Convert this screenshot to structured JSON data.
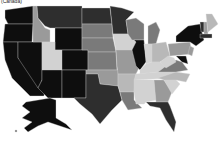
{
  "map": {
    "title_label": "(Canada)",
    "type": "choropleth",
    "palette": {
      "darkest": "#0e0e0e",
      "dark": "#2e2e2e",
      "mid_dark": "#555555",
      "mid": "#7a7a7a",
      "mid_light": "#9a9a9a",
      "light": "#b8b8b8",
      "lightest": "#d2d2d2"
    },
    "states": [
      {
        "id": "WA",
        "shade": "darkest"
      },
      {
        "id": "OR",
        "shade": "darkest"
      },
      {
        "id": "CA",
        "shade": "darkest"
      },
      {
        "id": "NV",
        "shade": "darkest"
      },
      {
        "id": "ID",
        "shade": "mid_light"
      },
      {
        "id": "MT",
        "shade": "dark"
      },
      {
        "id": "WY",
        "shade": "darkest"
      },
      {
        "id": "UT",
        "shade": "lightest"
      },
      {
        "id": "AZ",
        "shade": "darkest"
      },
      {
        "id": "CO",
        "shade": "darkest"
      },
      {
        "id": "NM",
        "shade": "darkest"
      },
      {
        "id": "ND",
        "shade": "dark"
      },
      {
        "id": "SD",
        "shade": "mid"
      },
      {
        "id": "NE",
        "shade": "mid"
      },
      {
        "id": "KS",
        "shade": "mid"
      },
      {
        "id": "OK",
        "shade": "mid_light"
      },
      {
        "id": "TX",
        "shade": "dark"
      },
      {
        "id": "MN",
        "shade": "dark"
      },
      {
        "id": "IA",
        "shade": "lightest"
      },
      {
        "id": "MO",
        "shade": "mid_light"
      },
      {
        "id": "AR",
        "shade": "light"
      },
      {
        "id": "LA",
        "shade": "mid"
      },
      {
        "id": "WI",
        "shade": "mid"
      },
      {
        "id": "IL",
        "shade": "darkest"
      },
      {
        "id": "MI",
        "shade": "mid"
      },
      {
        "id": "IN",
        "shade": "lightest"
      },
      {
        "id": "OH",
        "shade": "light"
      },
      {
        "id": "KY",
        "shade": "lightest"
      },
      {
        "id": "TN",
        "shade": "lightest"
      },
      {
        "id": "MS",
        "shade": "lightest"
      },
      {
        "id": "AL",
        "shade": "lightest"
      },
      {
        "id": "GA",
        "shade": "mid_light"
      },
      {
        "id": "FL",
        "shade": "dark"
      },
      {
        "id": "SC",
        "shade": "lightest"
      },
      {
        "id": "NC",
        "shade": "light"
      },
      {
        "id": "VA",
        "shade": "mid"
      },
      {
        "id": "WV",
        "shade": "lightest"
      },
      {
        "id": "PA",
        "shade": "mid_light"
      },
      {
        "id": "NY",
        "shade": "darkest"
      },
      {
        "id": "ME",
        "shade": "light"
      },
      {
        "id": "NH",
        "shade": "mid_light"
      },
      {
        "id": "VT",
        "shade": "dark"
      },
      {
        "id": "MA",
        "shade": "dark"
      },
      {
        "id": "NJ",
        "shade": "mid_light"
      },
      {
        "id": "MD",
        "shade": "darkest"
      },
      {
        "id": "AK",
        "shade": "darkest"
      },
      {
        "id": "HI",
        "shade": "mid"
      }
    ]
  }
}
